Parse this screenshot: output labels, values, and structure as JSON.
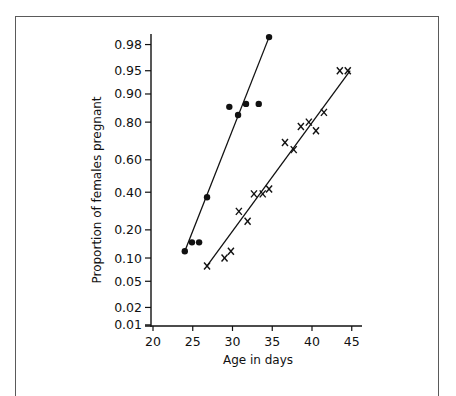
{
  "chart_data": {
    "type": "scatter",
    "title": "",
    "xlabel": "Age in days",
    "ylabel": "Proportion of females pregnant",
    "x_ticks": [
      20,
      25,
      30,
      35,
      40,
      45
    ],
    "x_tick_labels": [
      "20",
      "25",
      "30",
      "35",
      "40",
      "45"
    ],
    "xlim": [
      20,
      46.5
    ],
    "y_scale": "probit",
    "y_ticks": [
      0.01,
      0.02,
      0.05,
      0.1,
      0.2,
      0.4,
      0.6,
      0.8,
      0.9,
      0.95,
      0.98
    ],
    "y_tick_labels": [
      "0.01",
      "0.02",
      "0.05",
      "0.10",
      "0.20",
      "0.40",
      "0.60",
      "0.80",
      "0.90",
      "0.95",
      "0.98"
    ],
    "ylim": [
      0.01,
      0.99
    ],
    "grid": false,
    "legend": null,
    "series": [
      {
        "name": "dots",
        "marker": "filled-circle",
        "x": [
          24.0,
          24.9,
          25.8,
          26.8,
          29.6,
          30.7,
          31.7,
          33.3,
          34.6
        ],
        "y": [
          0.12,
          0.15,
          0.15,
          0.37,
          0.86,
          0.83,
          0.87,
          0.87,
          0.985
        ],
        "fit_line": {
          "x": [
            24.0,
            34.6
          ],
          "y": [
            0.12,
            0.985
          ]
        }
      },
      {
        "name": "crosses",
        "marker": "x",
        "x": [
          26.8,
          29.0,
          29.8,
          30.8,
          31.9,
          32.7,
          33.8,
          34.6,
          36.6,
          37.7,
          38.6,
          39.6,
          40.5,
          41.5,
          43.5,
          44.5
        ],
        "y": [
          0.08,
          0.1,
          0.12,
          0.29,
          0.24,
          0.39,
          0.39,
          0.42,
          0.7,
          0.66,
          0.78,
          0.8,
          0.76,
          0.84,
          0.95,
          0.95
        ],
        "fit_line": {
          "x": [
            26.8,
            44.8
          ],
          "y": [
            0.08,
            0.95
          ]
        }
      }
    ]
  },
  "axes": {
    "x_title": "Age in days",
    "y_title": "Proportion of females pregnant"
  }
}
